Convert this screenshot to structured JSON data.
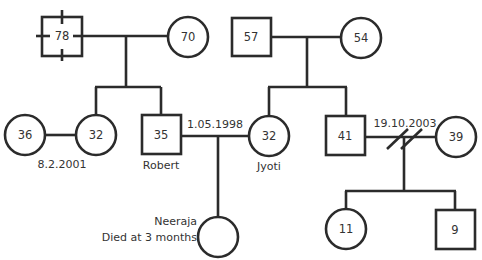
{
  "diagram": {
    "type": "genogram",
    "colors": {
      "line": "#2b2b2b",
      "text": "#333333",
      "background": "#ffffff"
    },
    "generation1": {
      "left_couple": {
        "male": {
          "age": "78",
          "shape": "square",
          "status": "deceased-cross"
        },
        "female": {
          "age": "70",
          "shape": "circle"
        }
      },
      "right_couple": {
        "male": {
          "age": "57",
          "shape": "square"
        },
        "female": {
          "age": "54",
          "shape": "circle"
        }
      }
    },
    "generation2": {
      "spouse_of_daughter": {
        "age": "36",
        "shape": "circle"
      },
      "daughter": {
        "age": "32",
        "shape": "circle"
      },
      "daughter_marriage_date": "8.2.2001",
      "robert": {
        "age": "35",
        "shape": "square",
        "name": "Robert"
      },
      "robert_jyoti_marriage_date": "1.05.1998",
      "jyoti": {
        "age": "32",
        "shape": "circle",
        "name": "Jyoti"
      },
      "son": {
        "age": "41",
        "shape": "square"
      },
      "son_divorce_date": "19.10.2003",
      "ex_wife": {
        "age": "39",
        "shape": "circle"
      }
    },
    "generation3": {
      "neeraja": {
        "age": "",
        "shape": "circle",
        "name": "Neeraja",
        "note": "Died at 3 months"
      },
      "daughter": {
        "age": "11",
        "shape": "circle"
      },
      "son": {
        "age": "9",
        "shape": "square"
      }
    }
  }
}
